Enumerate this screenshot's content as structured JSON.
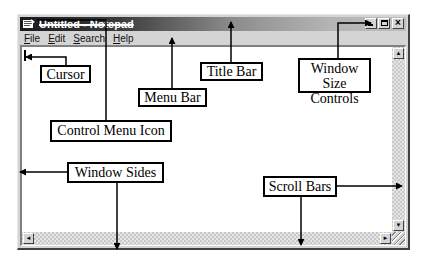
{
  "window": {
    "title": "Untitled - Notepad",
    "controls": {
      "minimize": "minimize-icon",
      "maximize": "maximize-icon",
      "close": "close-icon"
    },
    "menu": [
      {
        "label": "File",
        "accel": "F",
        "rest": "ile"
      },
      {
        "label": "Edit",
        "accel": "E",
        "rest": "dit"
      },
      {
        "label": "Search",
        "accel": "S",
        "rest": "earch"
      },
      {
        "label": "Help",
        "accel": "H",
        "rest": "elp"
      }
    ],
    "scrollbars": {
      "up_arrow": "▲",
      "down_arrow": "▼",
      "left_arrow": "◄",
      "right_arrow": "►"
    }
  },
  "callouts": {
    "cursor": "Cursor",
    "menu_bar": "Menu Bar",
    "title_bar": "Title Bar",
    "window_size_controls": "Window Size Controls",
    "control_menu_icon": "Control Menu Icon",
    "window_sides": "Window Sides",
    "scroll_bars": "Scroll Bars"
  },
  "colors": {
    "titlebar_dark": "#1a1a1a",
    "titlebar_light": "#bdbdbd",
    "frame": "#d4d4d4",
    "callout_line": "#000000"
  }
}
